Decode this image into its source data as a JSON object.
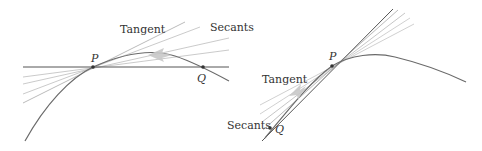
{
  "diagrams": [
    {
      "id": "left",
      "labels": {
        "tangent": "Tangent",
        "secants": "Secants",
        "p": "P",
        "q": "Q"
      },
      "description": "Secant lines through P approach tangent as Q moves left toward P along curve"
    },
    {
      "id": "right",
      "labels": {
        "tangent": "Tangent",
        "secants": "Secants",
        "p": "P",
        "q": "Q"
      },
      "description": "Secant lines through P approach tangent as Q moves right toward P along curve"
    }
  ],
  "colors": {
    "curve": "#707070",
    "tangent": "#555555",
    "secant": "#b5b5b5",
    "arrow": "#c8c8c8",
    "text": "#333333"
  }
}
